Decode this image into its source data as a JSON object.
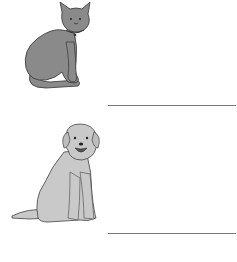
{
  "worksheet": {
    "items": [
      {
        "picture": "cat-illustration",
        "answer_line": "",
        "color": "#8a8a8a"
      },
      {
        "picture": "dog-illustration",
        "answer_line": "",
        "color": "#c9c9c9"
      }
    ]
  }
}
